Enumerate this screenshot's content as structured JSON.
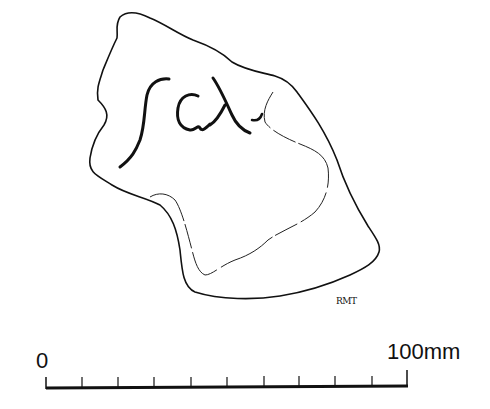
{
  "figure": {
    "inscription": "ΓCΛ",
    "signature": "RMT",
    "scale_bar": {
      "start_label": "0",
      "end_label": "100mm",
      "divisions": 10
    },
    "colors": {
      "line": "#111111",
      "background": "#ffffff"
    }
  }
}
